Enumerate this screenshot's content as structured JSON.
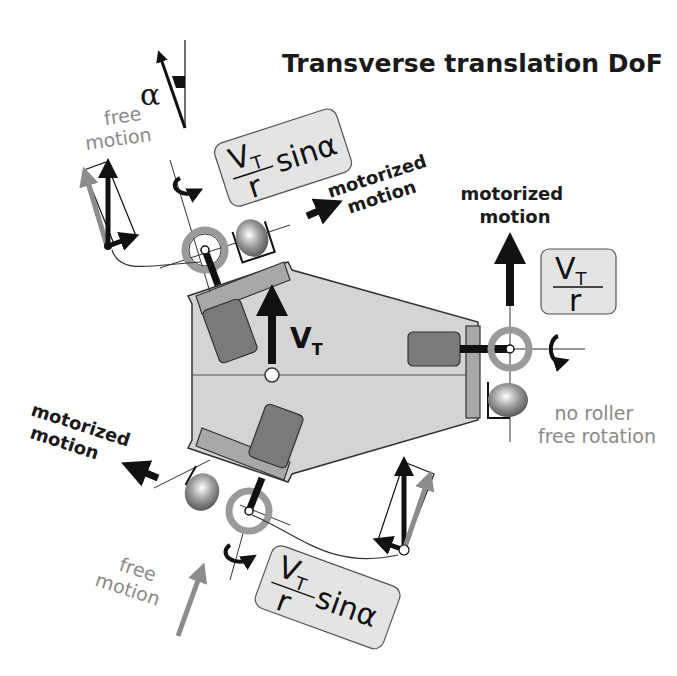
{
  "title": "Transverse translation DoF",
  "angle_symbol": "α",
  "body": {
    "velocity_label": "V",
    "velocity_subscript": "T",
    "fill_color": "#d4d4d4",
    "motor_color": "#7a7a7a",
    "plate_color": "#a8a8a8"
  },
  "wheels": {
    "top_left": {
      "motor_label_line1": "motorized",
      "motor_label_line2": "motion",
      "free_label_line1": "free",
      "free_label_line2": "motion",
      "formula_num": "V",
      "formula_sub": "T",
      "formula_den": "r",
      "formula_suffix": "sinα"
    },
    "right": {
      "motor_label_line1": "motorized",
      "motor_label_line2": "motion",
      "formula_num": "V",
      "formula_sub": "T",
      "formula_den": "r",
      "roller_label_line1": "no roller",
      "roller_label_line2": "free rotation"
    },
    "bottom_left": {
      "motor_label_line1": "motorized",
      "motor_label_line2": "motion",
      "free_label_line1": "free",
      "free_label_line2": "motion",
      "formula_num": "V",
      "formula_sub": "T",
      "formula_den": "r",
      "formula_suffix": "sinα"
    }
  },
  "colors": {
    "dark_arrow": "#111111",
    "gray_arrow": "#8c8c8c",
    "formula_box": "#e4e4e4",
    "wheel_ring": "#9a9a9a"
  }
}
